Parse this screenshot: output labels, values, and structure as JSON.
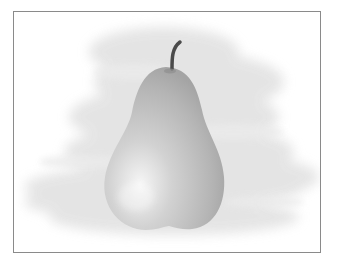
{
  "image": {
    "subject": "pear",
    "description": "Grayscale illustration of a single pear with a curved stem against a soft brushed gray background, inside a thin gray border",
    "colors": {
      "border": "#8a8a8a",
      "background": "#ffffff",
      "brush": "#e4e4e4",
      "pear_light": "#f4f4f4",
      "pear_mid": "#c8c8c8",
      "pear_dark": "#a8a8a8",
      "stem": "#4a4a4a"
    }
  }
}
